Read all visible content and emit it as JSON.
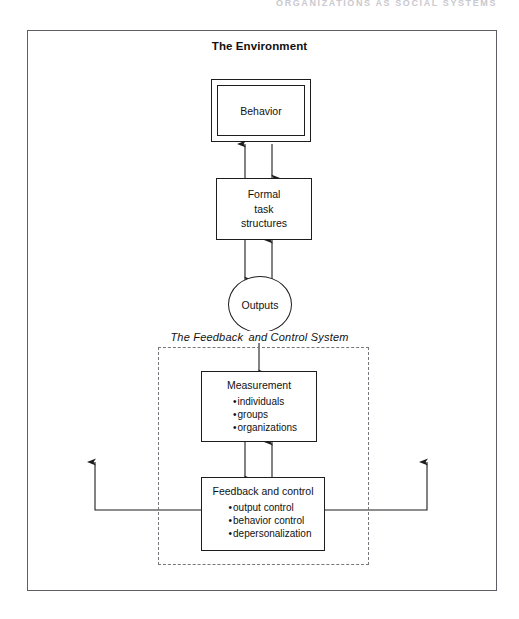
{
  "page": {
    "running_head": "ORGANIZATIONS AS SOCIAL SYSTEMS",
    "env_title": "The Environment"
  },
  "nodes": {
    "behavior": {
      "label": "Behavior"
    },
    "formal_task": {
      "line1": "Formal",
      "line2": "task",
      "line3": "structures"
    },
    "outputs": {
      "label": "Outputs"
    },
    "measurement": {
      "label": "Measurement",
      "bullets": [
        "individuals",
        "groups",
        "organizations"
      ]
    },
    "feedback_control": {
      "label": "Feedback and control",
      "bullets": [
        "output control",
        "behavior control",
        "depersonalization"
      ]
    }
  },
  "subsystem": {
    "label_left": "The Feedback",
    "label_right": "and Control System"
  },
  "colors": {
    "line": "#1d1d1f",
    "outer_border": "#5d5d63",
    "dashed_border": "#76767c",
    "running_head": "#c9c9cf",
    "background": "#ffffff"
  }
}
